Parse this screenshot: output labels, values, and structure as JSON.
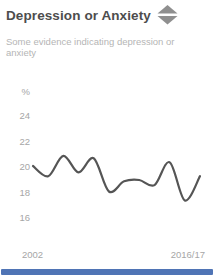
{
  "card": {
    "title": "Depression or Anxiety",
    "subtitle": "Some evidence indicating depression or anxiety",
    "trend_icon": "no-change-diamond-icon",
    "icon_color": "#8f8f8f",
    "accent_color": "#4f74b5"
  },
  "chart_data": {
    "type": "line",
    "title": "Depression or Anxiety",
    "ylabel": "%",
    "xlabel": "",
    "y_ticks": [
      24,
      22,
      20,
      18,
      16
    ],
    "ylim": [
      15.5,
      25
    ],
    "x_tick_labels": [
      "2002",
      "2016/17"
    ],
    "grid": false,
    "legend": false,
    "line_color": "#555555",
    "series": [
      {
        "name": "Some evidence indicating depression or anxiety (%)",
        "values": [
          20.0,
          19.2,
          20.8,
          19.5,
          20.6,
          18.0,
          18.8,
          18.9,
          18.5,
          20.3,
          17.3,
          19.2
        ]
      }
    ]
  }
}
